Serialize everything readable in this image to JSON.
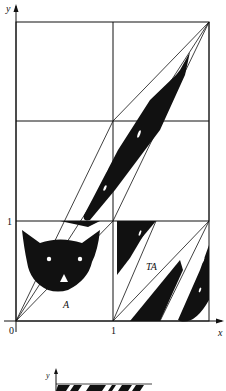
{
  "figure": {
    "axes": {
      "y_label": "y",
      "x_label": "x",
      "origin_label": "0",
      "x_tick_label": "1",
      "y_tick_label": "1"
    },
    "regions": {
      "original_label": "A",
      "transformed_label": "TA"
    },
    "grid": {
      "columns": 2,
      "rows": 3
    },
    "colors": {
      "ink": "#111111",
      "paper": "#ffffff"
    }
  },
  "second_figure": {
    "y_label": "y"
  }
}
